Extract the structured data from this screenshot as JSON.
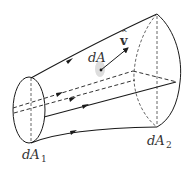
{
  "diagram": {
    "type": "flow tube (stream tube) with area elements",
    "labels": {
      "left_area": "dA",
      "left_area_sub": "1",
      "right_area": "dA",
      "right_area_sub": "2",
      "side_area": "dA",
      "velocity": "v",
      "velocity_hat": "^"
    },
    "colors": {
      "stroke": "#1a1a1a",
      "dashed": "#555555",
      "text": "#333333",
      "shade": "#dddddd"
    }
  }
}
